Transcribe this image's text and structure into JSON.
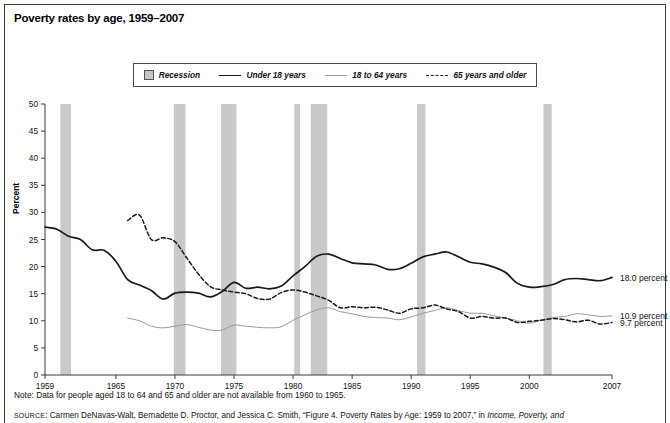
{
  "title": "Poverty rates by age, 1959–2007",
  "legend": {
    "items": [
      {
        "label": "Recession",
        "marker": "recession-swatch"
      },
      {
        "label": "Under 18 years",
        "marker": "solid-line"
      },
      {
        "label": "18 to 64 years",
        "marker": "thin-line"
      },
      {
        "label": "65 years and older",
        "marker": "dashed-line"
      }
    ]
  },
  "note": "Note: Data for people aged 18 to 64 and 65 and older are not available from 1960 to 1965.",
  "source": {
    "prefix": "SOURCE",
    "rest": ": Carmen DeNavas-Walt, Bernadette D. Proctor, and Jessica C. Smith, “Figure 4. Poverty Rates by Age: 1959 to 2007,” in ",
    "italic": "Income, Poverty, and"
  },
  "end_labels": [
    {
      "text": "18.0 percent",
      "series": "Under 18 years",
      "value": 18.0
    },
    {
      "text": "10.9 percent",
      "series": "18 to 64 years",
      "value": 10.9
    },
    {
      "text": "9.7 percent",
      "series": "65 years and older",
      "value": 9.7
    }
  ],
  "colors": {
    "under18": "#1a1a1a",
    "age18to64": "#9a9a9a",
    "age65plus": "#1a1a1a",
    "recession_band": "#c9c9c9",
    "axis": "#3a3a3a",
    "frame": "#3a3a3a"
  },
  "chart_data": {
    "type": "line",
    "title": "Poverty rates by age, 1959–2007",
    "xlabel": "",
    "ylabel": "Percent",
    "xlim": [
      1959,
      2007
    ],
    "ylim": [
      0,
      50
    ],
    "yticks": [
      0,
      5,
      10,
      15,
      20,
      25,
      30,
      35,
      40,
      45,
      50
    ],
    "xticks": [
      1959,
      1965,
      1970,
      1975,
      1980,
      1985,
      1990,
      1995,
      2000,
      2007
    ],
    "grid": false,
    "legend_position": "top-center",
    "annotations": [
      "18.0 percent",
      "10.9 percent",
      "9.7 percent",
      "Note: Data for people aged 18 to 64 and 65 and older are not available from 1960 to 1965."
    ],
    "recession_bands": [
      {
        "start": 1960.3,
        "end": 1961.2
      },
      {
        "start": 1969.9,
        "end": 1970.9
      },
      {
        "start": 1973.9,
        "end": 1975.2
      },
      {
        "start": 1980.1,
        "end": 1980.6
      },
      {
        "start": 1981.5,
        "end": 1982.9
      },
      {
        "start": 1990.5,
        "end": 1991.2
      },
      {
        "start": 2001.2,
        "end": 2001.9
      }
    ],
    "series": [
      {
        "name": "Under 18 years",
        "style": "solid",
        "color": "#1a1a1a",
        "x": [
          1959,
          1960,
          1961,
          1962,
          1963,
          1964,
          1965,
          1966,
          1967,
          1968,
          1969,
          1970,
          1971,
          1972,
          1973,
          1974,
          1975,
          1976,
          1977,
          1978,
          1979,
          1980,
          1981,
          1982,
          1983,
          1984,
          1985,
          1986,
          1987,
          1988,
          1989,
          1990,
          1991,
          1992,
          1993,
          1994,
          1995,
          1996,
          1997,
          1998,
          1999,
          2000,
          2001,
          2002,
          2003,
          2004,
          2005,
          2006,
          2007
        ],
        "values": [
          27.3,
          26.9,
          25.6,
          25.0,
          23.1,
          23.0,
          21.0,
          17.6,
          16.6,
          15.6,
          14.0,
          15.1,
          15.3,
          15.1,
          14.4,
          15.4,
          17.1,
          16.0,
          16.2,
          15.9,
          16.4,
          18.3,
          20.0,
          21.9,
          22.3,
          21.5,
          20.7,
          20.5,
          20.3,
          19.5,
          19.6,
          20.6,
          21.8,
          22.3,
          22.7,
          21.8,
          20.8,
          20.5,
          19.9,
          18.9,
          16.9,
          16.2,
          16.3,
          16.7,
          17.6,
          17.8,
          17.6,
          17.4,
          18.0
        ]
      },
      {
        "name": "18 to 64 years",
        "style": "thin",
        "color": "#9a9a9a",
        "x": [
          1966,
          1967,
          1968,
          1969,
          1970,
          1971,
          1972,
          1973,
          1974,
          1975,
          1976,
          1977,
          1978,
          1979,
          1980,
          1981,
          1982,
          1983,
          1984,
          1985,
          1986,
          1987,
          1988,
          1989,
          1990,
          1991,
          1992,
          1993,
          1994,
          1995,
          1996,
          1997,
          1998,
          1999,
          2000,
          2001,
          2002,
          2003,
          2004,
          2005,
          2006,
          2007
        ],
        "values": [
          10.5,
          10.0,
          9.0,
          8.7,
          9.0,
          9.3,
          8.8,
          8.3,
          8.3,
          9.2,
          9.0,
          8.8,
          8.7,
          8.9,
          10.1,
          11.1,
          12.0,
          12.4,
          11.7,
          11.3,
          10.8,
          10.6,
          10.5,
          10.2,
          10.7,
          11.4,
          11.9,
          12.4,
          11.9,
          11.4,
          11.4,
          10.9,
          10.5,
          10.0,
          9.6,
          10.1,
          10.6,
          10.8,
          11.3,
          11.1,
          10.8,
          10.9
        ]
      },
      {
        "name": "65 years and older",
        "style": "dashed",
        "color": "#1a1a1a",
        "x": [
          1966,
          1967,
          1968,
          1969,
          1970,
          1971,
          1972,
          1973,
          1974,
          1975,
          1976,
          1977,
          1978,
          1979,
          1980,
          1981,
          1982,
          1983,
          1984,
          1985,
          1986,
          1987,
          1988,
          1989,
          1990,
          1991,
          1992,
          1993,
          1994,
          1995,
          1996,
          1997,
          1998,
          1999,
          2000,
          2001,
          2002,
          2003,
          2004,
          2005,
          2006,
          2007
        ],
        "values": [
          28.5,
          29.5,
          25.0,
          25.3,
          24.6,
          21.6,
          18.6,
          16.3,
          15.7,
          15.3,
          15.0,
          14.1,
          14.0,
          15.2,
          15.7,
          15.3,
          14.6,
          13.8,
          12.4,
          12.6,
          12.4,
          12.5,
          12.0,
          11.4,
          12.2,
          12.4,
          12.9,
          12.2,
          11.7,
          10.5,
          10.8,
          10.5,
          10.5,
          9.7,
          9.9,
          10.1,
          10.4,
          10.2,
          9.8,
          10.1,
          9.4,
          9.7
        ]
      }
    ]
  }
}
